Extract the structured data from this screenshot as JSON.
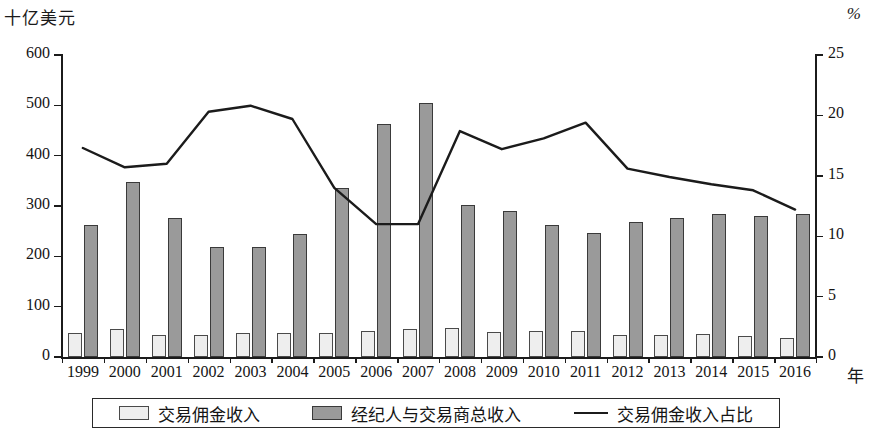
{
  "axes": {
    "left_title": "十亿美元",
    "right_title": "%",
    "x_title": "年",
    "left_ticks": [
      "0",
      "100",
      "200",
      "300",
      "400",
      "500",
      "600"
    ],
    "right_ticks": [
      "0",
      "5",
      "10",
      "15",
      "20",
      "25"
    ]
  },
  "legend": {
    "items": [
      {
        "label": "交易佣金收入",
        "marker": "light-square-swatch"
      },
      {
        "label": "经纪人与交易商总收入",
        "marker": "dark-square-swatch"
      },
      {
        "label": "交易佣金收入占比",
        "marker": "line-swatch"
      }
    ]
  },
  "chart_data": {
    "type": "bar",
    "title": "",
    "xlabel": "年",
    "ylabel": "十亿美元",
    "y2label": "%",
    "ylim": [
      0,
      600
    ],
    "y2lim": [
      0,
      25
    ],
    "grid": false,
    "legend_position": "bottom",
    "categories": [
      "1999",
      "2000",
      "2001",
      "2002",
      "2003",
      "2004",
      "2005",
      "2006",
      "2007",
      "2008",
      "2009",
      "2010",
      "2011",
      "2012",
      "2013",
      "2014",
      "2015",
      "2016"
    ],
    "series": [
      {
        "name": "交易佣金收入",
        "type": "bar",
        "axis": "left",
        "unit": "十亿美元",
        "values": [
          47,
          55,
          43,
          44,
          48,
          48,
          48,
          51,
          55,
          58,
          49,
          51,
          51,
          44,
          44,
          45,
          41,
          37
        ]
      },
      {
        "name": "经纪人与交易商总收入",
        "type": "bar",
        "axis": "left",
        "unit": "十亿美元",
        "values": [
          263,
          347,
          276,
          219,
          218,
          244,
          336,
          462,
          504,
          302,
          291,
          263,
          246,
          269,
          276,
          285,
          280,
          285
        ]
      },
      {
        "name": "交易佣金收入占比",
        "type": "line",
        "axis": "right",
        "unit": "%",
        "values": [
          17.3,
          15.7,
          16.0,
          20.3,
          20.8,
          19.7,
          14.0,
          11.0,
          11.0,
          18.7,
          17.2,
          18.1,
          19.4,
          15.6,
          14.9,
          14.3,
          13.8,
          12.2
        ]
      }
    ]
  }
}
